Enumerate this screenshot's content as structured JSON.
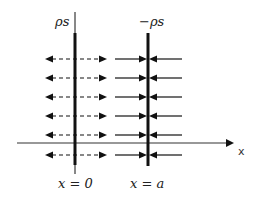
{
  "diagram": {
    "title": "",
    "labels": {
      "left_plate_charge": "ρs",
      "right_plate_charge": "−ρs",
      "left_plate_position": "x = 0",
      "right_plate_position": "x = a",
      "axis": "x"
    },
    "plates": [
      {
        "id": "left",
        "x": 75,
        "charge": "+ρs",
        "field_style": "dashed",
        "field_direction": "outward"
      },
      {
        "id": "right",
        "x": 148,
        "charge": "−ρs",
        "field_style": "solid",
        "field_direction": "inward"
      }
    ],
    "field_rows_y": [
      59,
      78,
      97,
      116,
      135,
      155
    ],
    "axis_y": 143,
    "colors": {
      "ink": "#111111",
      "axis": "#333333"
    }
  }
}
